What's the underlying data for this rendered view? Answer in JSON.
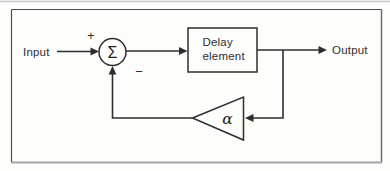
{
  "figure": {
    "type": "feedback-block-diagram",
    "labels": {
      "input": "Input",
      "output": "Output",
      "plus": "+",
      "minus": "−",
      "sum": "Σ",
      "delay_line1": "Delay",
      "delay_line2": "element",
      "gain": "α"
    },
    "colors": {
      "background": "#fdfdfb",
      "line": "#2e2e2e",
      "text": "#2f2f2f",
      "frame": "#4f4f4f",
      "frame_bottom": "#a3a3a3",
      "page_edge_line": "#c6c6c6",
      "shape_fill": "#fdfdfb"
    }
  }
}
